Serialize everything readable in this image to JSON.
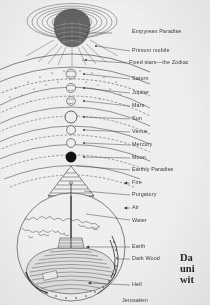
{
  "figure": {
    "title_visible": false,
    "background_color": "#f3f2f0",
    "ink_color": "#333333"
  },
  "caption": {
    "lines": [
      "Da",
      "uni",
      "wit"
    ],
    "note_clipped_right": true
  },
  "labels": [
    {
      "id": "empyrean-paradise",
      "text": "Empyrean Paradise",
      "x": 132,
      "y": 29,
      "leader_x1": 112,
      "leader_y1": 33,
      "leader_x2": 86,
      "leader_y2": 33
    },
    {
      "id": "primum-mobile",
      "text": "Primum mobile",
      "x": 132,
      "y": 48,
      "leader_x1": 130,
      "leader_y1": 51,
      "leader_x2": 96,
      "leader_y2": 46
    },
    {
      "id": "fixed-stars-zodiac",
      "text": "Fixed stars—the Zodiac",
      "x": 129,
      "y": 60,
      "leader_x1": 127,
      "leader_y1": 63,
      "leader_x2": 82,
      "leader_y2": 60
    },
    {
      "id": "saturn",
      "text": "Saturn",
      "x": 132,
      "y": 76,
      "leader_x1": 130,
      "leader_y1": 79,
      "leader_x2": 84,
      "leader_y2": 74
    },
    {
      "id": "jupiter",
      "text": "Jupiter",
      "x": 132,
      "y": 90,
      "leader_x1": 130,
      "leader_y1": 93,
      "leader_x2": 84,
      "leader_y2": 88
    },
    {
      "id": "mars",
      "text": "Mars",
      "x": 132,
      "y": 103,
      "leader_x1": 130,
      "leader_y1": 106,
      "leader_x2": 84,
      "leader_y2": 101
    },
    {
      "id": "sun",
      "text": "Sun",
      "x": 132,
      "y": 116,
      "leader_x1": 130,
      "leader_y1": 119,
      "leader_x2": 84,
      "leader_y2": 117
    },
    {
      "id": "venus",
      "text": "Venus",
      "x": 132,
      "y": 129,
      "leader_x1": 130,
      "leader_y1": 132,
      "leader_x2": 84,
      "leader_y2": 130
    },
    {
      "id": "mercury",
      "text": "Mercury",
      "x": 132,
      "y": 142,
      "leader_x1": 130,
      "leader_y1": 145,
      "leader_x2": 84,
      "leader_y2": 143
    },
    {
      "id": "moon",
      "text": "Moon",
      "x": 132,
      "y": 155,
      "leader_x1": 130,
      "leader_y1": 158,
      "leader_x2": 84,
      "leader_y2": 157
    },
    {
      "id": "earthly-paradise",
      "text": "Earthly Paradise",
      "x": 132,
      "y": 167,
      "leader_x1": 130,
      "leader_y1": 170,
      "leader_x2": 76,
      "leader_y2": 166
    },
    {
      "id": "fire",
      "text": "Fire",
      "x": 132,
      "y": 180,
      "leader_x1": 130,
      "leader_y1": 183,
      "leader_x2": 124,
      "leader_y2": 183
    },
    {
      "id": "purgatory",
      "text": "Purgatory",
      "x": 132,
      "y": 192,
      "leader_x1": 130,
      "leader_y1": 195,
      "leader_x2": 84,
      "leader_y2": 191
    },
    {
      "id": "air",
      "text": "Air",
      "x": 132,
      "y": 205,
      "leader_x1": 130,
      "leader_y1": 208,
      "leader_x2": 124,
      "leader_y2": 208
    },
    {
      "id": "water",
      "text": "Water",
      "x": 132,
      "y": 218,
      "leader_x1": 130,
      "leader_y1": 220,
      "leader_x2": 86,
      "leader_y2": 214
    },
    {
      "id": "earth",
      "text": "Earth",
      "x": 132,
      "y": 244,
      "leader_x1": 130,
      "leader_y1": 247,
      "leader_x2": 86,
      "leader_y2": 247
    },
    {
      "id": "dark-wood",
      "text": "Dark Wood",
      "x": 132,
      "y": 256,
      "leader_x1": 130,
      "leader_y1": 259,
      "leader_x2": 116,
      "leader_y2": 259
    },
    {
      "id": "hell",
      "text": "Hell",
      "x": 132,
      "y": 282,
      "leader_x1": 130,
      "leader_y1": 285,
      "leader_x2": 88,
      "leader_y2": 283
    },
    {
      "id": "jerusalem",
      "text": "Jerusalem",
      "x": 122,
      "y": 298,
      "leader_x1": 0,
      "leader_y1": 0,
      "leader_x2": 0,
      "leader_y2": 0
    }
  ],
  "spheres": {
    "center_x": 71,
    "planets": [
      {
        "id": "saturn-orb",
        "cy": 74,
        "r": 5.0,
        "fill": "none"
      },
      {
        "id": "jupiter-orb",
        "cy": 88,
        "r": 4.6,
        "fill": "none"
      },
      {
        "id": "mars-orb",
        "cy": 101,
        "r": 4.4,
        "fill": "none"
      },
      {
        "id": "sun-orb",
        "cy": 117,
        "r": 6.0,
        "fill": "none"
      },
      {
        "id": "venus-orb",
        "cy": 130,
        "r": 4.4,
        "fill": "none"
      },
      {
        "id": "mercury-orb",
        "cy": 143,
        "r": 4.4,
        "fill": "none"
      },
      {
        "id": "moon-orb",
        "cy": 157,
        "r": 5.2,
        "fill": "#111111"
      }
    ]
  },
  "earth": {
    "center_x": 71,
    "center_y": 247,
    "radius": 54
  },
  "empyrean": {
    "center_x": 72,
    "center_y": 22,
    "rings": 9
  }
}
